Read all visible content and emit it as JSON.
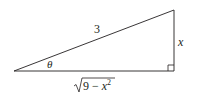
{
  "diagram": {
    "type": "right-triangle",
    "labels": {
      "hypotenuse": "3",
      "opposite": "x",
      "angle": "θ",
      "adjacent_radicand_prefix": "9 − ",
      "adjacent_var": "x",
      "adjacent_exp": "2"
    },
    "vertices": {
      "angle_vertex": [
        14,
        71
      ],
      "right_angle_vertex": [
        174,
        71
      ],
      "top_vertex": [
        174,
        10
      ]
    },
    "colors": {
      "stroke": "#231f20",
      "background": "#ffffff"
    }
  }
}
